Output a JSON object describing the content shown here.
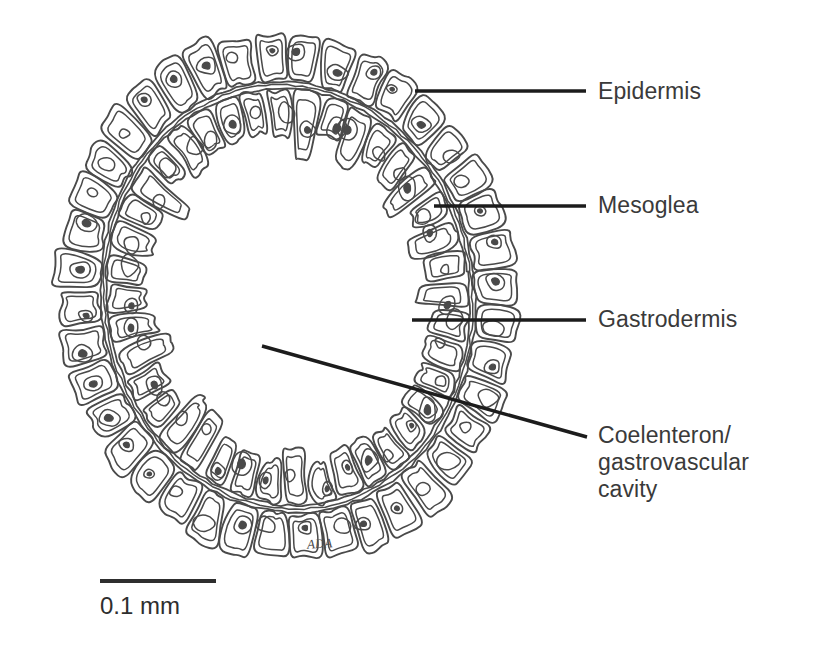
{
  "figure": {
    "kind": "biological-cross-section-diagram",
    "background_color": "#ffffff",
    "ink_color": "#4a4a4a",
    "leader_color": "#1c1c1c"
  },
  "labels": [
    {
      "id": "epidermis",
      "text": "Epidermis",
      "text_x": 598,
      "text_y": 78,
      "leader": {
        "x1": 415,
        "y1": 91,
        "x2": 586,
        "y2": 91
      }
    },
    {
      "id": "mesoglea",
      "text": "Mesoglea",
      "text_x": 598,
      "text_y": 192,
      "leader": {
        "x1": 434,
        "y1": 206,
        "x2": 586,
        "y2": 206
      }
    },
    {
      "id": "gastrodermis",
      "text": "Gastrodermis",
      "text_x": 598,
      "text_y": 306,
      "leader": {
        "x1": 412,
        "y1": 320,
        "x2": 586,
        "y2": 320
      }
    },
    {
      "id": "coelenteron",
      "text": "Coelenteron/\ngastrovascular\ncavity",
      "text_x": 598,
      "text_y": 422,
      "leader": {
        "x1": 262,
        "y1": 346,
        "x2": 587,
        "y2": 437
      }
    }
  ],
  "scale_bar": {
    "label": "0.1 mm",
    "label_x": 100,
    "label_y": 592,
    "bar": {
      "x1": 100,
      "y1": 581,
      "x2": 216,
      "y2": 581
    },
    "thickness": 4
  },
  "signature": {
    "text": "ADA",
    "x": 307,
    "y": 536
  },
  "ring_geometry": {
    "center_x": 288,
    "center_y": 297,
    "outer_rx": 232,
    "outer_ry": 268,
    "rotation_deg": -8,
    "epidermis_thickness": 52,
    "mesoglea_thickness": 7,
    "gastrodermis_thickness": 46,
    "inner_cavity_rx": 122,
    "inner_cavity_ry": 158,
    "epidermis_cell_count": 40,
    "gastrodermis_cell_count": 40
  },
  "layers": [
    {
      "name": "Epidermis",
      "position": "outer",
      "description": "outer layer of boxy cells with nuclei"
    },
    {
      "name": "Mesoglea",
      "position": "middle",
      "description": "thin acellular jelly layer"
    },
    {
      "name": "Gastrodermis",
      "position": "inner",
      "description": "inner layer of columnar cells lining the cavity"
    },
    {
      "name": "Coelenteron/gastrovascular cavity",
      "position": "lumen",
      "description": "empty central cavity"
    }
  ]
}
